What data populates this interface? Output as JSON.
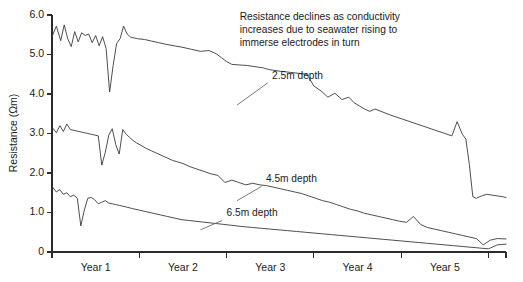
{
  "chart_data": {
    "type": "line",
    "title": "",
    "xlabel": "",
    "ylabel": "Resistance (Ωm)",
    "ylim": [
      0,
      6.0
    ],
    "xlim": [
      0,
      5.2
    ],
    "grid": false,
    "legend_position": "inline-annotations",
    "y_ticks": [
      "0",
      "1.0",
      "2.0",
      "3.0",
      "4.0",
      "5.0",
      "6.0"
    ],
    "y_tick_values": [
      0,
      1.0,
      2.0,
      3.0,
      4.0,
      5.0,
      6.0
    ],
    "x_tick_labels": [
      "Year 1",
      "Year 2",
      "Year 3",
      "Year 4",
      "Year 5"
    ],
    "x_tick_values": [
      0,
      1,
      2,
      3,
      4,
      5,
      5.2
    ],
    "annotations": [
      {
        "name": "resistance-note",
        "lines": [
          "Resistance declines as conductivity",
          "increases due to seawater rising to",
          "immerse electrodes in turn"
        ],
        "x": 2.15,
        "y": 5.88
      }
    ],
    "series": [
      {
        "name": "2.5m depth",
        "label": "2.5m depth",
        "label_x": 2.52,
        "label_y": 4.38,
        "leader_from_x": 2.47,
        "leader_from_y": 4.28,
        "leader_to_x": 2.12,
        "leader_to_y": 3.72,
        "x": [
          0.0,
          0.05,
          0.1,
          0.14,
          0.18,
          0.22,
          0.26,
          0.3,
          0.34,
          0.38,
          0.42,
          0.46,
          0.5,
          0.54,
          0.58,
          0.62,
          0.66,
          0.7,
          0.74,
          0.78,
          0.82,
          0.86,
          0.9,
          0.94,
          0.98,
          1.06,
          1.14,
          1.22,
          1.3,
          1.4,
          1.5,
          1.6,
          1.7,
          1.8,
          1.88,
          1.94,
          2.0,
          2.06,
          2.12,
          2.18,
          2.24,
          2.3,
          2.36,
          2.42,
          2.48,
          2.54,
          2.6,
          2.68,
          2.76,
          2.84,
          2.92,
          3.0,
          3.08,
          3.16,
          3.24,
          3.32,
          3.4,
          3.46,
          3.52,
          3.58,
          3.64,
          3.7,
          3.78,
          3.86,
          3.94,
          4.02,
          4.1,
          4.18,
          4.26,
          4.34,
          4.42,
          4.5,
          4.58,
          4.64,
          4.7,
          4.74,
          4.78,
          4.82,
          4.86,
          4.92,
          4.98,
          5.04,
          5.1,
          5.16,
          5.2
        ],
        "y": [
          5.45,
          5.72,
          5.35,
          5.75,
          5.4,
          5.2,
          5.58,
          5.32,
          5.55,
          5.48,
          5.52,
          5.3,
          5.48,
          5.22,
          5.45,
          5.15,
          4.05,
          4.72,
          5.28,
          5.4,
          5.72,
          5.52,
          5.44,
          5.42,
          5.4,
          5.38,
          5.34,
          5.3,
          5.26,
          5.22,
          5.18,
          5.13,
          5.08,
          5.1,
          5.02,
          4.92,
          4.82,
          4.75,
          4.74,
          4.73,
          4.72,
          4.7,
          4.68,
          4.66,
          4.62,
          4.6,
          4.58,
          4.56,
          4.54,
          4.52,
          4.5,
          4.2,
          4.08,
          3.92,
          4.02,
          3.86,
          3.92,
          3.78,
          3.7,
          3.62,
          3.56,
          3.62,
          3.55,
          3.48,
          3.42,
          3.36,
          3.3,
          3.24,
          3.18,
          3.12,
          3.06,
          3.0,
          2.94,
          3.3,
          2.98,
          2.86,
          2.22,
          1.4,
          1.36,
          1.42,
          1.46,
          1.44,
          1.42,
          1.4,
          1.38
        ]
      },
      {
        "name": "4.5m depth",
        "label": "4.5m depth",
        "label_x": 2.45,
        "label_y": 1.78,
        "leader_from_x": 2.4,
        "leader_from_y": 1.66,
        "leader_to_x": 2.12,
        "leader_to_y": 1.3,
        "x": [
          0.0,
          0.05,
          0.09,
          0.13,
          0.17,
          0.21,
          0.25,
          0.29,
          0.33,
          0.37,
          0.41,
          0.45,
          0.49,
          0.53,
          0.57,
          0.61,
          0.65,
          0.69,
          0.73,
          0.77,
          0.81,
          0.85,
          0.89,
          0.93,
          0.97,
          1.02,
          1.08,
          1.14,
          1.2,
          1.26,
          1.32,
          1.38,
          1.44,
          1.5,
          1.58,
          1.66,
          1.74,
          1.82,
          1.9,
          1.98,
          2.06,
          2.14,
          2.22,
          2.3,
          2.38,
          2.46,
          2.54,
          2.62,
          2.7,
          2.78,
          2.86,
          2.94,
          3.02,
          3.1,
          3.18,
          3.26,
          3.34,
          3.42,
          3.5,
          3.58,
          3.66,
          3.74,
          3.82,
          3.9,
          3.98,
          4.06,
          4.14,
          4.22,
          4.3,
          4.38,
          4.46,
          4.54,
          4.62,
          4.7,
          4.78,
          4.86,
          4.94,
          5.02,
          5.1,
          5.2
        ],
        "y": [
          3.16,
          3.02,
          3.2,
          3.05,
          3.24,
          3.1,
          3.08,
          3.06,
          3.04,
          3.02,
          3.0,
          2.98,
          2.96,
          2.94,
          2.2,
          2.52,
          2.96,
          3.12,
          2.72,
          2.48,
          3.1,
          2.98,
          2.9,
          2.82,
          2.76,
          2.7,
          2.62,
          2.56,
          2.5,
          2.44,
          2.38,
          2.32,
          2.28,
          2.24,
          2.16,
          2.1,
          2.04,
          1.98,
          1.94,
          1.76,
          1.82,
          1.76,
          1.7,
          1.74,
          1.7,
          1.68,
          1.64,
          1.6,
          1.56,
          1.52,
          1.48,
          1.42,
          1.36,
          1.3,
          1.26,
          1.2,
          1.14,
          1.08,
          1.04,
          0.98,
          0.94,
          0.9,
          0.86,
          0.82,
          0.78,
          0.75,
          0.9,
          0.7,
          0.62,
          0.58,
          0.54,
          0.5,
          0.46,
          0.42,
          0.38,
          0.34,
          0.18,
          0.3,
          0.34,
          0.33
        ]
      },
      {
        "name": "6.5m depth",
        "label": "6.5m depth",
        "label_x": 2.0,
        "label_y": 0.92,
        "leader_from_x": 1.95,
        "leader_from_y": 0.8,
        "leader_to_x": 1.7,
        "leader_to_y": 0.56,
        "x": [
          0.0,
          0.05,
          0.09,
          0.13,
          0.17,
          0.21,
          0.25,
          0.29,
          0.33,
          0.37,
          0.41,
          0.45,
          0.49,
          0.53,
          0.57,
          0.61,
          0.65,
          0.69,
          0.73,
          0.77,
          0.81,
          0.85,
          0.92,
          1.0,
          1.08,
          1.16,
          1.24,
          1.32,
          1.4,
          1.48,
          1.56,
          1.64,
          1.72,
          1.8,
          1.88,
          1.96,
          2.04,
          2.12,
          2.2,
          2.3,
          2.4,
          2.5,
          2.6,
          2.7,
          2.8,
          2.9,
          3.0,
          3.1,
          3.2,
          3.3,
          3.4,
          3.5,
          3.6,
          3.7,
          3.8,
          3.9,
          4.0,
          4.1,
          4.2,
          4.3,
          4.4,
          4.5,
          4.6,
          4.7,
          4.8,
          4.9,
          5.0,
          5.1,
          5.2
        ],
        "y": [
          1.66,
          1.52,
          1.58,
          1.46,
          1.5,
          1.4,
          1.44,
          1.36,
          0.66,
          1.06,
          1.36,
          1.38,
          1.32,
          1.22,
          1.26,
          1.3,
          1.24,
          1.22,
          1.2,
          1.18,
          1.16,
          1.14,
          1.1,
          1.06,
          1.02,
          0.98,
          0.94,
          0.9,
          0.86,
          0.82,
          0.8,
          0.78,
          0.76,
          0.74,
          0.72,
          0.7,
          0.68,
          0.66,
          0.64,
          0.62,
          0.6,
          0.58,
          0.56,
          0.54,
          0.52,
          0.5,
          0.48,
          0.46,
          0.44,
          0.42,
          0.4,
          0.38,
          0.36,
          0.34,
          0.32,
          0.3,
          0.28,
          0.26,
          0.24,
          0.22,
          0.2,
          0.18,
          0.16,
          0.14,
          0.12,
          0.1,
          0.08,
          0.18,
          0.2
        ]
      }
    ]
  }
}
